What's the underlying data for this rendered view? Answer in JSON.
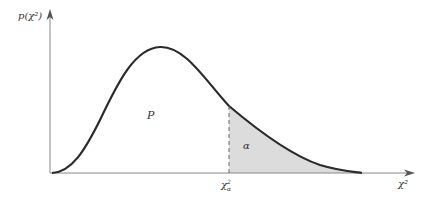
{
  "diagram": {
    "y_axis_label": "p(χ²)",
    "x_axis_label": "χ²",
    "critical_value_label": "χ²α",
    "region_labels": {
      "acceptance": "P",
      "rejection": "α"
    },
    "colors": {
      "curve": "#2a2a2a",
      "axis": "#888888",
      "shade": "#dcdcdc",
      "dash": "#666666"
    }
  }
}
